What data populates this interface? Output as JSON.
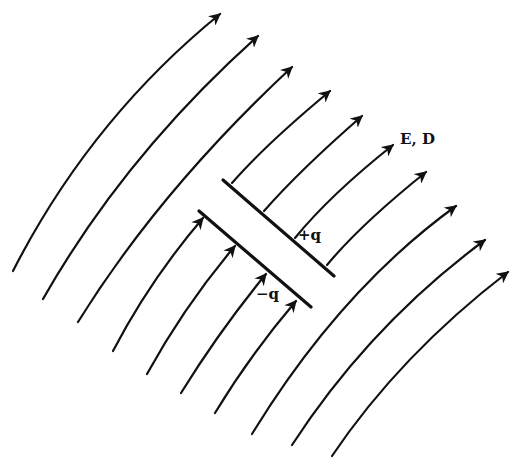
{
  "figure": {
    "type": "parallel-plate capacitor in an external field",
    "field_label": "E, D",
    "positive_plate_label": "+q",
    "negative_plate_label": "−q",
    "field_line_count": 12,
    "colors": {
      "ink": "#111111",
      "background": "#ffffff"
    }
  }
}
